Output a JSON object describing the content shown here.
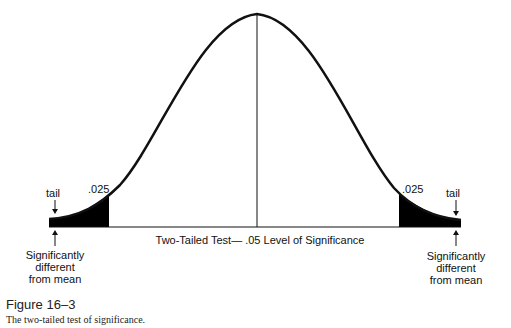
{
  "diagram": {
    "baseline_label": "Two-Tailed Test— .05 Level of Significance",
    "left_tail": {
      "area_label": ".025",
      "tail_label": "tail",
      "description_lines": [
        "Significantly",
        "different",
        "from mean"
      ]
    },
    "right_tail": {
      "area_label": ".025",
      "tail_label": "tail",
      "description_lines": [
        "Significantly",
        "different",
        "from mean"
      ]
    },
    "colors": {
      "curve": "#111111",
      "tail_fill": "#000000",
      "background": "#ffffff"
    }
  },
  "caption": {
    "figure_number": "Figure 16–3",
    "text": "The two-tailed test of significance."
  }
}
